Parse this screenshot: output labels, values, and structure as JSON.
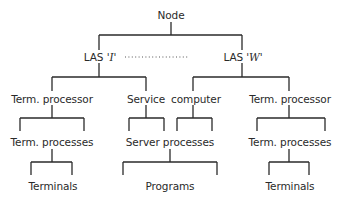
{
  "diagram": {
    "type": "hierarchy-tree",
    "root": {
      "label": "Node"
    },
    "las_left": {
      "prefix": "LAS ",
      "name": "'I'"
    },
    "las_right": {
      "prefix": "LAS ",
      "name": "'W'"
    },
    "connector_las": "dotted",
    "left_branch": {
      "level1": "Term. processor",
      "level2": "Term. processes",
      "level3": "Terminals"
    },
    "center_branch": {
      "level1_a": "Service",
      "level1_b": "computer",
      "level2": "Server processes",
      "level3": "Programs"
    },
    "right_branch": {
      "level1": "Term. processor",
      "level2": "Term. processes",
      "level3": "Terminals"
    }
  }
}
